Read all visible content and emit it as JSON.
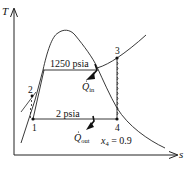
{
  "diagram": {
    "type": "T-s diagram (Rankine cycle)",
    "axes": {
      "y_label": "T",
      "x_label": "s"
    },
    "states": [
      {
        "id": "1",
        "label": "1"
      },
      {
        "id": "2",
        "label": "2"
      },
      {
        "id": "3",
        "label": "3"
      },
      {
        "id": "4",
        "label": "4"
      }
    ],
    "pressure_lines": {
      "high": "1250 psia",
      "low": "2 psia"
    },
    "heat": {
      "in_symbol": "Q",
      "in_sub": "in",
      "out_symbol": "Q",
      "out_sub": "out"
    },
    "quality": {
      "var": "x",
      "sub": "4",
      "rest": " = 0.9"
    },
    "colors": {
      "line": "#222222",
      "background": "#ffffff"
    }
  }
}
